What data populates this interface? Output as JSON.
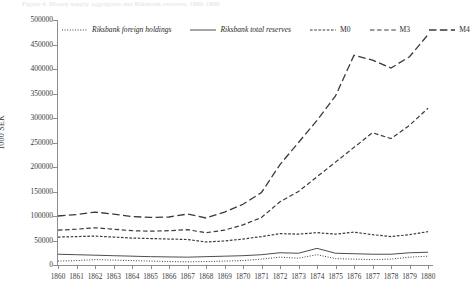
{
  "top_caption": "Figure 4. Money supply aggregates and Riksbank reserves, 1860-1880",
  "chart_data": {
    "type": "line",
    "title": "",
    "xlabel": "",
    "ylabel": "1000 SEK",
    "ylim": [
      0,
      500000
    ],
    "ytick_step": 50000,
    "yticks": [
      500000,
      450000,
      400000,
      350000,
      300000,
      250000,
      200000,
      150000,
      100000,
      50000,
      0
    ],
    "ytick_labels": [
      "500000",
      "450000",
      "400000",
      "350000",
      "300000",
      "250000",
      "200000",
      "150000",
      "100000",
      "50000",
      "0"
    ],
    "grid": false,
    "legend_position": "top-inside",
    "categories": [
      1860,
      1861,
      1862,
      1863,
      1864,
      1865,
      1866,
      1867,
      1868,
      1869,
      1870,
      1871,
      1872,
      1873,
      1874,
      1875,
      1876,
      1877,
      1878,
      1879,
      1880
    ],
    "xtick_labels": [
      "1860",
      "1861",
      "1862",
      "1863",
      "1864",
      "1865",
      "1866",
      "1867",
      "1868",
      "1869",
      "1870",
      "1871",
      "1872",
      "1873",
      "1874",
      "1875",
      "1876",
      "1877",
      "1878",
      "1879",
      "1880"
    ],
    "series": [
      {
        "name": "Riksbank foreign holdings",
        "style": "dotted",
        "color": "#3a3a3a",
        "values": [
          8000,
          9000,
          11000,
          10000,
          9000,
          8000,
          7000,
          6500,
          7000,
          8000,
          9000,
          12000,
          16000,
          14000,
          21000,
          13000,
          12000,
          11000,
          12000,
          16000,
          18000
        ]
      },
      {
        "name": "Riksbank total reserves",
        "style": "solid",
        "color": "#3a3a3a",
        "values": [
          22000,
          21000,
          20000,
          19000,
          18000,
          17000,
          16500,
          16000,
          17000,
          18000,
          19000,
          21000,
          25000,
          24000,
          34000,
          24000,
          23000,
          22000,
          22000,
          25000,
          26000
        ]
      },
      {
        "name": "M0",
        "style": "fine-dash",
        "color": "#3a3a3a",
        "values": [
          57000,
          58000,
          59000,
          57000,
          55000,
          54000,
          53000,
          52000,
          47000,
          49000,
          53000,
          58000,
          64000,
          63000,
          66000,
          63000,
          67000,
          62000,
          58000,
          62000,
          68000
        ]
      },
      {
        "name": "M3",
        "style": "medium-dash",
        "color": "#3a3a3a",
        "values": [
          71000,
          73000,
          76000,
          73000,
          70000,
          69000,
          70000,
          72000,
          66000,
          71000,
          82000,
          97000,
          129000,
          150000,
          180000,
          210000,
          240000,
          270000,
          258000,
          285000,
          320000
        ]
      },
      {
        "name": "M4",
        "style": "long-dash",
        "color": "#3a3a3a",
        "values": [
          100000,
          103000,
          108000,
          104000,
          99000,
          97000,
          98000,
          104000,
          96000,
          108000,
          124000,
          148000,
          205000,
          250000,
          295000,
          345000,
          428000,
          418000,
          402000,
          425000,
          470000
        ]
      }
    ]
  }
}
